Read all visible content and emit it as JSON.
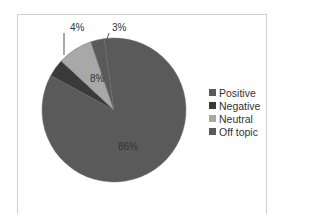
{
  "chart_data": {
    "type": "pie",
    "title": "",
    "categories": [
      "Positive",
      "Negative",
      "Neutral",
      "Off topic"
    ],
    "values": [
      86,
      4,
      8,
      3
    ],
    "labels": [
      "86%",
      "4%",
      "8%",
      "3%"
    ],
    "colors": [
      "#5a5a5a",
      "#3a3a3a",
      "#a8a8a8",
      "#5a5a5a"
    ],
    "legend_position": "right"
  },
  "legend": {
    "items": [
      {
        "label": "Positive",
        "color": "#5a5a5a"
      },
      {
        "label": "Negative",
        "color": "#3a3a3a"
      },
      {
        "label": "Neutral",
        "color": "#a8a8a8"
      },
      {
        "label": "Off topic",
        "color": "#5a5a5a"
      }
    ]
  },
  "data_labels": {
    "positive": "86%",
    "negative": "4%",
    "neutral": "8%",
    "off_topic": "3%"
  }
}
